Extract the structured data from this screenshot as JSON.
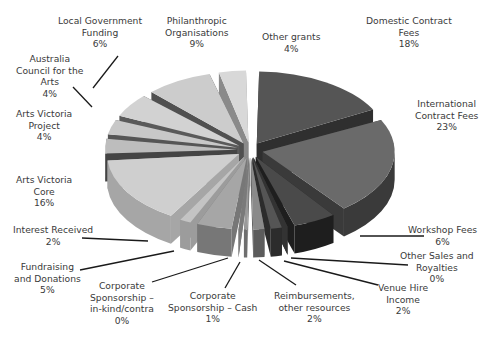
{
  "chart_data": {
    "type": "pie",
    "style": "3d-exploded",
    "title": "",
    "slices": [
      {
        "label": "Domestic Contract Fees",
        "value": 18,
        "color": "#555555",
        "side": "#2f2f2f"
      },
      {
        "label": "International Contract Fees",
        "value": 23,
        "color": "#6a6a6a",
        "side": "#3a3a3a"
      },
      {
        "label": "Workshop Fees",
        "value": 6,
        "color": "#4a4a4a",
        "side": "#1e1e1e"
      },
      {
        "label": "Other Sales and Royalties",
        "value": 0,
        "color": "#5a5a5a",
        "side": "#333333"
      },
      {
        "label": "Venue Hire Income",
        "value": 2,
        "color": "#555555",
        "side": "#2c2c2c"
      },
      {
        "label": "Reimbursements, other resources",
        "value": 2,
        "color": "#8a8a8a",
        "side": "#5c5c5c"
      },
      {
        "label": "Corporate Sponsorship – Cash",
        "value": 1,
        "color": "#9a9a9a",
        "side": "#6e6e6e"
      },
      {
        "label": "Corporate Sponsorship – in-kind/contra",
        "value": 0,
        "color": "#aaaaaa",
        "side": "#7a7a7a"
      },
      {
        "label": "Fundraising and Donations",
        "value": 5,
        "color": "#a6a6a6",
        "side": "#777777"
      },
      {
        "label": "Interest Received",
        "value": 2,
        "color": "#c4c4c4",
        "side": "#9c9c9c"
      },
      {
        "label": "Arts Victoria Core",
        "value": 16,
        "color": "#cfcfcf",
        "side": "#a6a6a6"
      },
      {
        "label": "Arts Victoria Project",
        "value": 4,
        "color": "#bdbdbd",
        "side": "#444444"
      },
      {
        "label": "Australia Council for the Arts",
        "value": 4,
        "color": "#c8c8c8",
        "side": "#555555"
      },
      {
        "label": "Local Government Funding",
        "value": 6,
        "color": "#d2d2d2",
        "side": "#5a5a5a"
      },
      {
        "label": "Philanthropic Organisations",
        "value": 9,
        "color": "#cccccc",
        "side": "#505050"
      },
      {
        "label": "Other grants",
        "value": 4,
        "color": "#d8d8d8",
        "side": "#8a8a8a"
      }
    ],
    "unit": "%",
    "legend": "none (leader-line labels)"
  },
  "labels": [
    {
      "lines": [
        "Local Government",
        "Funding",
        "6%"
      ]
    },
    {
      "lines": [
        "Philanthropic",
        "Organisations",
        "9%"
      ]
    },
    {
      "lines": [
        "Other grants",
        "4%"
      ]
    },
    {
      "lines": [
        "Domestic Contract",
        "Fees",
        "18%"
      ]
    },
    {
      "lines": [
        "Australia",
        "Council for the",
        "Arts",
        "4%"
      ]
    },
    {
      "lines": [
        "International",
        "Contract Fees",
        "23%"
      ]
    },
    {
      "lines": [
        "Arts Victoria",
        "Project",
        "4%"
      ]
    },
    {
      "lines": [
        "Arts Victoria",
        "Core",
        "16%"
      ]
    },
    {
      "lines": [
        "Interest Received",
        "2%"
      ]
    },
    {
      "lines": [
        "Workshop Fees",
        "6%"
      ]
    },
    {
      "lines": [
        "Other Sales and",
        "Royalties",
        "0%"
      ]
    },
    {
      "lines": [
        "Fundraising",
        "and Donations",
        "5%"
      ]
    },
    {
      "lines": [
        "Venue Hire",
        "Income",
        "2%"
      ]
    },
    {
      "lines": [
        "Corporate",
        "Sponsorship –",
        "in-kind/contra",
        "0%"
      ]
    },
    {
      "lines": [
        "Corporate",
        "Sponsorship – Cash",
        "1%"
      ]
    },
    {
      "lines": [
        "Reimbursements,",
        "other resources",
        "2%"
      ]
    }
  ]
}
